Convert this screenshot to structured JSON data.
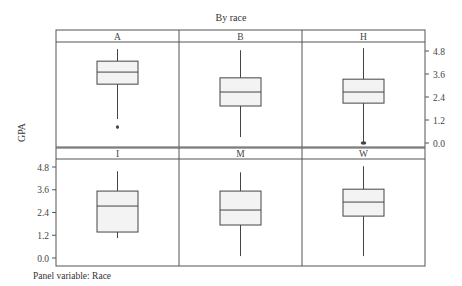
{
  "chart_data": {
    "type": "boxplot",
    "title": "By race",
    "xlabel": "",
    "ylabel": "GPA",
    "footer": "Panel variable: Race",
    "ylim": [
      0.0,
      4.8
    ],
    "yticks": [
      0.0,
      1.2,
      2.4,
      3.6,
      4.8
    ],
    "ytick_labels": [
      "0.0",
      "1.2",
      "2.4",
      "3.6",
      "4.8"
    ],
    "layout": {
      "rows": 2,
      "cols": 3,
      "right_axis_row": 0,
      "left_axis_row": 1
    },
    "panels": [
      {
        "label": "A",
        "whisker_low": 1.25,
        "q1": 3.07,
        "median": 3.7,
        "q3": 4.27,
        "whisker_high": 4.9,
        "outliers": [
          0.83
        ]
      },
      {
        "label": "B",
        "whisker_low": 0.31,
        "q1": 1.93,
        "median": 2.66,
        "q3": 3.4,
        "whisker_high": 4.84,
        "outliers": []
      },
      {
        "label": "H",
        "whisker_low": 0.05,
        "q1": 2.08,
        "median": 2.66,
        "q3": 3.33,
        "whisker_high": 4.95,
        "outliers": [
          0.0
        ]
      },
      {
        "label": "I",
        "whisker_low": 1.05,
        "q1": 1.37,
        "median": 2.74,
        "q3": 3.53,
        "whisker_high": 4.58,
        "outliers": []
      },
      {
        "label": "M",
        "whisker_low": 0.1,
        "q1": 1.74,
        "median": 2.53,
        "q3": 3.53,
        "whisker_high": 4.52,
        "outliers": []
      },
      {
        "label": "W",
        "whisker_low": 0.1,
        "q1": 2.21,
        "median": 2.95,
        "q3": 3.63,
        "whisker_high": 4.84,
        "outliers": []
      }
    ],
    "colors": {
      "box_fill": "#f3f3f3",
      "line": "#444444",
      "frame": "#555555"
    }
  }
}
